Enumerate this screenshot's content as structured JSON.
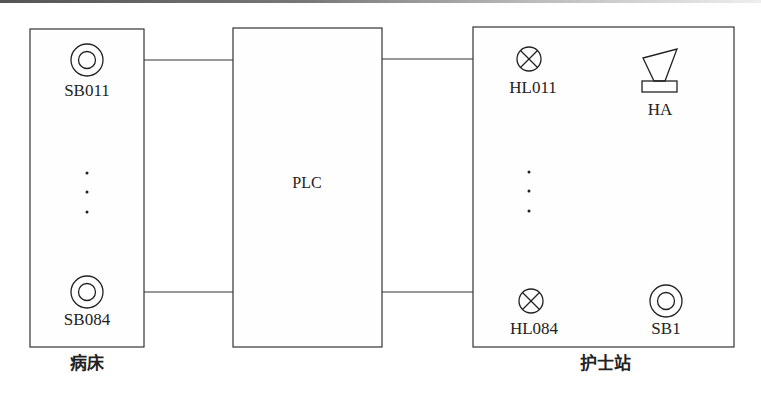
{
  "diagram": {
    "blocks": {
      "bedside": {
        "caption": "病床",
        "items": [
          {
            "label": "SB011",
            "icon": "button-icon"
          },
          {
            "label": "SB084",
            "icon": "button-icon"
          }
        ],
        "ellipsis": "⋮"
      },
      "plc": {
        "label": "PLC"
      },
      "nurse_station": {
        "caption": "护士站",
        "items": [
          {
            "label": "HL011",
            "icon": "lamp-icon"
          },
          {
            "label": "HA",
            "icon": "buzzer-icon"
          },
          {
            "label": "HL084",
            "icon": "lamp-icon"
          },
          {
            "label": "SB1",
            "icon": "button-icon"
          }
        ],
        "ellipsis": "⋮"
      }
    },
    "connections": [
      {
        "from": "bedside",
        "to": "plc",
        "row": "top"
      },
      {
        "from": "bedside",
        "to": "plc",
        "row": "bottom"
      },
      {
        "from": "plc",
        "to": "nurse_station",
        "row": "top"
      },
      {
        "from": "plc",
        "to": "nurse_station",
        "row": "bottom"
      }
    ]
  }
}
